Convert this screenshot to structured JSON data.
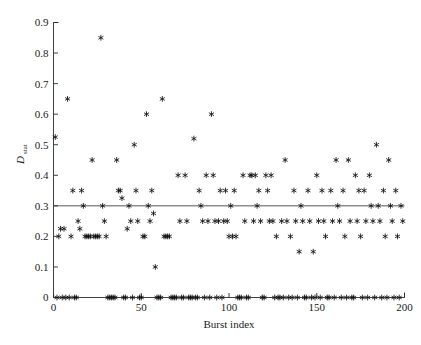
{
  "figure": {
    "background_color": "#ffffff",
    "marker_color": "#101010",
    "axis_color": "#2b2b2b",
    "marker_symbol": "asterisk-marker"
  },
  "chart_data": {
    "type": "scatter",
    "title": "",
    "xlabel": "Burst index",
    "ylabel": "D_stat",
    "ylabel_base": "D",
    "ylabel_subscript": "stat",
    "xlim": [
      0,
      200
    ],
    "ylim": [
      0,
      0.9
    ],
    "xticks": [
      0,
      50,
      100,
      150,
      200
    ],
    "xtick_labels": [
      "0",
      "50",
      "100",
      "150",
      "200"
    ],
    "yticks": [
      0,
      0.1,
      0.2,
      0.3,
      0.4,
      0.5,
      0.6,
      0.7,
      0.8,
      0.9
    ],
    "ytick_labels": [
      "0",
      "0.1",
      "0.2",
      "0.3",
      "0.4",
      "0.5",
      "0.6",
      "0.7",
      "0.8",
      "0.9"
    ],
    "grid": false,
    "legend": null,
    "legend_position": "none",
    "annotations": [
      {
        "name": "threshold-line",
        "type": "horizontal-line",
        "y": 0.3,
        "label": ""
      }
    ],
    "series": [
      {
        "name": "D_stat per burst",
        "marker": "asterisk",
        "color": "#101010",
        "points": [
          [
            1,
            0.525
          ],
          [
            2,
            0.0
          ],
          [
            3,
            0.2
          ],
          [
            4,
            0.225
          ],
          [
            5,
            0.0
          ],
          [
            6,
            0.225
          ],
          [
            7,
            0.0
          ],
          [
            8,
            0.65
          ],
          [
            9,
            0.0
          ],
          [
            10,
            0.2
          ],
          [
            11,
            0.35
          ],
          [
            12,
            0.0
          ],
          [
            13,
            0.0
          ],
          [
            14,
            0.25
          ],
          [
            15,
            0.225
          ],
          [
            16,
            0.35
          ],
          [
            17,
            0.3
          ],
          [
            18,
            0.2
          ],
          [
            19,
            0.2
          ],
          [
            20,
            0.2
          ],
          [
            21,
            0.2
          ],
          [
            22,
            0.45
          ],
          [
            23,
            0.2
          ],
          [
            24,
            0.2
          ],
          [
            25,
            0.2
          ],
          [
            26,
            0.2
          ],
          [
            27,
            0.85
          ],
          [
            28,
            0.3
          ],
          [
            29,
            0.25
          ],
          [
            30,
            0.2
          ],
          [
            31,
            0.0
          ],
          [
            32,
            0.0
          ],
          [
            33,
            0.0
          ],
          [
            34,
            0.0
          ],
          [
            35,
            0.0
          ],
          [
            36,
            0.45
          ],
          [
            37,
            0.35
          ],
          [
            38,
            0.35
          ],
          [
            39,
            0.325
          ],
          [
            40,
            0.0
          ],
          [
            41,
            0.0
          ],
          [
            42,
            0.225
          ],
          [
            43,
            0.3
          ],
          [
            44,
            0.25
          ],
          [
            45,
            0.0
          ],
          [
            46,
            0.5
          ],
          [
            47,
            0.35
          ],
          [
            48,
            0.25
          ],
          [
            49,
            0.0
          ],
          [
            50,
            0.0
          ],
          [
            51,
            0.2
          ],
          [
            52,
            0.2
          ],
          [
            53,
            0.6
          ],
          [
            54,
            0.3
          ],
          [
            55,
            0.25
          ],
          [
            56,
            0.35
          ],
          [
            57,
            0.275
          ],
          [
            58,
            0.1
          ],
          [
            59,
            0.0
          ],
          [
            60,
            0.0
          ],
          [
            61,
            0.0
          ],
          [
            62,
            0.65
          ],
          [
            63,
            0.2
          ],
          [
            64,
            0.2
          ],
          [
            65,
            0.2
          ],
          [
            66,
            0.2
          ],
          [
            67,
            0.0
          ],
          [
            68,
            0.0
          ],
          [
            69,
            0.0
          ],
          [
            70,
            0.0
          ],
          [
            71,
            0.4
          ],
          [
            72,
            0.25
          ],
          [
            73,
            0.0
          ],
          [
            74,
            0.0
          ],
          [
            75,
            0.4
          ],
          [
            76,
            0.25
          ],
          [
            77,
            0.0
          ],
          [
            78,
            0.0
          ],
          [
            79,
            0.0
          ],
          [
            80,
            0.52
          ],
          [
            81,
            0.0
          ],
          [
            82,
            0.0
          ],
          [
            83,
            0.35
          ],
          [
            84,
            0.3
          ],
          [
            85,
            0.25
          ],
          [
            86,
            0.0
          ],
          [
            87,
            0.4
          ],
          [
            88,
            0.25
          ],
          [
            89,
            0.0
          ],
          [
            90,
            0.6
          ],
          [
            91,
            0.4
          ],
          [
            92,
            0.25
          ],
          [
            93,
            0.0
          ],
          [
            94,
            0.25
          ],
          [
            95,
            0.35
          ],
          [
            96,
            0.0
          ],
          [
            97,
            0.25
          ],
          [
            98,
            0.35
          ],
          [
            99,
            0.25
          ],
          [
            100,
            0.2
          ],
          [
            101,
            0.3
          ],
          [
            102,
            0.2
          ],
          [
            103,
            0.35
          ],
          [
            104,
            0.2
          ],
          [
            105,
            0.0
          ],
          [
            106,
            0.0
          ],
          [
            107,
            0.0
          ],
          [
            108,
            0.4
          ],
          [
            109,
            0.25
          ],
          [
            110,
            0.0
          ],
          [
            111,
            0.0
          ],
          [
            112,
            0.4
          ],
          [
            113,
            0.4
          ],
          [
            114,
            0.25
          ],
          [
            115,
            0.4
          ],
          [
            116,
            0.3
          ],
          [
            117,
            0.35
          ],
          [
            118,
            0.25
          ],
          [
            119,
            0.0
          ],
          [
            120,
            0.0
          ],
          [
            121,
            0.4
          ],
          [
            122,
            0.35
          ],
          [
            123,
            0.25
          ],
          [
            124,
            0.4
          ],
          [
            125,
            0.25
          ],
          [
            126,
            0.0
          ],
          [
            127,
            0.2
          ],
          [
            128,
            0.0
          ],
          [
            129,
            0.0
          ],
          [
            130,
            0.25
          ],
          [
            131,
            0.0
          ],
          [
            132,
            0.45
          ],
          [
            133,
            0.25
          ],
          [
            134,
            0.0
          ],
          [
            135,
            0.2
          ],
          [
            136,
            0.0
          ],
          [
            137,
            0.35
          ],
          [
            138,
            0.25
          ],
          [
            139,
            0.0
          ],
          [
            140,
            0.15
          ],
          [
            141,
            0.3
          ],
          [
            142,
            0.25
          ],
          [
            143,
            0.0
          ],
          [
            144,
            0.0
          ],
          [
            145,
            0.35
          ],
          [
            146,
            0.25
          ],
          [
            147,
            0.0
          ],
          [
            148,
            0.15
          ],
          [
            149,
            0.0
          ],
          [
            150,
            0.4
          ],
          [
            151,
            0.25
          ],
          [
            152,
            0.0
          ],
          [
            153,
            0.35
          ],
          [
            154,
            0.25
          ],
          [
            155,
            0.2
          ],
          [
            156,
            0.0
          ],
          [
            157,
            0.0
          ],
          [
            158,
            0.35
          ],
          [
            159,
            0.25
          ],
          [
            160,
            0.0
          ],
          [
            161,
            0.45
          ],
          [
            162,
            0.3
          ],
          [
            163,
            0.25
          ],
          [
            164,
            0.0
          ],
          [
            165,
            0.35
          ],
          [
            166,
            0.2
          ],
          [
            167,
            0.0
          ],
          [
            168,
            0.45
          ],
          [
            169,
            0.25
          ],
          [
            170,
            0.0
          ],
          [
            171,
            0.0
          ],
          [
            172,
            0.4
          ],
          [
            173,
            0.25
          ],
          [
            174,
            0.35
          ],
          [
            175,
            0.2
          ],
          [
            176,
            0.0
          ],
          [
            177,
            0.35
          ],
          [
            178,
            0.25
          ],
          [
            179,
            0.0
          ],
          [
            180,
            0.4
          ],
          [
            181,
            0.3
          ],
          [
            182,
            0.25
          ],
          [
            183,
            0.0
          ],
          [
            184,
            0.5
          ],
          [
            185,
            0.3
          ],
          [
            186,
            0.25
          ],
          [
            187,
            0.0
          ],
          [
            188,
            0.35
          ],
          [
            189,
            0.2
          ],
          [
            190,
            0.0
          ],
          [
            191,
            0.45
          ],
          [
            192,
            0.3
          ],
          [
            193,
            0.25
          ],
          [
            194,
            0.0
          ],
          [
            195,
            0.35
          ],
          [
            196,
            0.2
          ],
          [
            197,
            0.0
          ],
          [
            198,
            0.3
          ],
          [
            199,
            0.25
          ]
        ]
      }
    ]
  }
}
